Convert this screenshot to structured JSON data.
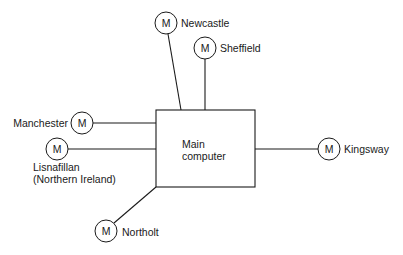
{
  "diagram": {
    "type": "star-network",
    "hub": {
      "label_line1": "Main",
      "label_line2": "computer"
    },
    "node_symbol": "M",
    "nodes": [
      {
        "id": "newcastle",
        "label": "Newcastle"
      },
      {
        "id": "sheffield",
        "label": "Sheffield"
      },
      {
        "id": "manchester",
        "label": "Manchester"
      },
      {
        "id": "lisnafillan",
        "label_line1": "Lisnafillan",
        "label_line2": "(Northern Ireland)"
      },
      {
        "id": "kingsway",
        "label": "Kingsway"
      },
      {
        "id": "northolt",
        "label": "Northolt"
      }
    ],
    "colors": {
      "stroke": "#1a1a1a",
      "background": "#ffffff"
    }
  }
}
